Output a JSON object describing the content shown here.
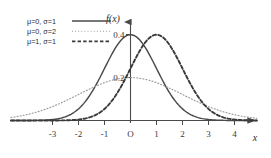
{
  "chart_data": {
    "type": "line",
    "title": "",
    "xlabel": "x",
    "ylabel": "f(x)",
    "xlim": [
      -4.6,
      4.9
    ],
    "ylim": [
      0,
      0.47
    ],
    "grid": false,
    "legend_position": "top-left",
    "x_ticks": [
      "-3",
      "-2",
      "-1",
      "O",
      "1",
      "2",
      "3",
      "4"
    ],
    "x_tick_values": [
      -3,
      -2,
      -1,
      0,
      1,
      2,
      3,
      4
    ],
    "y_value_labels": [
      {
        "text": "0.4",
        "value": 0.4
      },
      {
        "text": "0.2",
        "value": 0.2
      }
    ],
    "series": [
      {
        "name": "mu0sigma1",
        "legend": "μ=0, σ=1",
        "mu": 0,
        "sigma": 1,
        "style": "solid",
        "color": "#4a4a4a",
        "peak": 0.399,
        "x": [
          -4.6,
          -4.0,
          -3.5,
          -3.0,
          -2.5,
          -2.0,
          -1.5,
          -1.0,
          -0.5,
          0.0,
          0.5,
          1.0,
          1.5,
          2.0,
          2.5,
          3.0,
          3.5,
          4.0,
          4.9
        ],
        "y": [
          0.0,
          0.0,
          0.001,
          0.004,
          0.018,
          0.054,
          0.13,
          0.242,
          0.352,
          0.399,
          0.352,
          0.242,
          0.13,
          0.054,
          0.018,
          0.004,
          0.001,
          0.0,
          0.0
        ]
      },
      {
        "name": "mu0sigma2",
        "legend": "μ=0, σ=2",
        "mu": 0,
        "sigma": 2,
        "style": "dotted",
        "color": "#9a9a9a",
        "peak": 0.199,
        "x": [
          -4.6,
          -4.0,
          -3.5,
          -3.0,
          -2.5,
          -2.0,
          -1.5,
          -1.0,
          -0.5,
          0.0,
          0.5,
          1.0,
          1.5,
          2.0,
          2.5,
          3.0,
          3.5,
          4.0,
          4.9
        ],
        "y": [
          0.033,
          0.054,
          0.073,
          0.091,
          0.109,
          0.121,
          0.151,
          0.176,
          0.193,
          0.199,
          0.193,
          0.176,
          0.151,
          0.121,
          0.109,
          0.091,
          0.073,
          0.054,
          0.026
        ]
      },
      {
        "name": "mu1sigma1",
        "legend": "μ=1, σ=1",
        "mu": 1,
        "sigma": 1,
        "style": "dashed",
        "color": "#3a3a3a",
        "peak": 0.399,
        "x": [
          -4.6,
          -4.0,
          -3.5,
          -3.0,
          -2.5,
          -2.0,
          -1.5,
          -1.0,
          -0.5,
          0.0,
          0.5,
          1.0,
          1.5,
          2.0,
          2.5,
          3.0,
          3.5,
          4.0,
          4.9
        ],
        "y": [
          0.0,
          0.0,
          0.0,
          0.0,
          0.001,
          0.004,
          0.018,
          0.054,
          0.13,
          0.242,
          0.352,
          0.399,
          0.352,
          0.242,
          0.13,
          0.054,
          0.018,
          0.004,
          0.0
        ]
      }
    ]
  },
  "axes": {
    "x_axis_name": "x",
    "y_axis_name": "f(x)"
  },
  "legend": {
    "entries": [
      {
        "label": "μ=0, σ=1",
        "style": "solid"
      },
      {
        "label": "μ=0, σ=2",
        "style": "dotted"
      },
      {
        "label": "μ=1, σ=1",
        "style": "dashed"
      }
    ]
  },
  "labels": {
    "peak_high": "0.4",
    "peak_low": "0.2",
    "origin": "O",
    "tick_m3": "-3",
    "tick_m2": "-2",
    "tick_m1": "-1",
    "tick_1": "1",
    "tick_2": "2",
    "tick_3": "3",
    "tick_4": "4"
  },
  "colors": {
    "background": "#ffffff",
    "axis": "#4a4a4a",
    "solid_curve": "#4a4a4a",
    "dotted_curve": "#9a9a9a",
    "dashed_curve": "#3a3a3a",
    "text": "#2b2b2b"
  }
}
